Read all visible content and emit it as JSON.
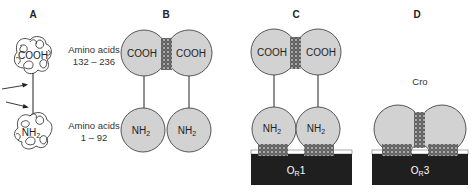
{
  "figure": {
    "colors": {
      "domain_fill": "#d2d2d2",
      "outline": "#444444",
      "dna_fill": "#1f1f1f",
      "contact_fill": "#8a8a8a",
      "text": "#222222"
    },
    "panels": [
      {
        "letter": "A",
        "top_domain": "COOH",
        "bottom_domain": "NH",
        "bottom_subscript": "2",
        "top_range_label": "Amino acids",
        "top_range_value": "132 – 236",
        "bottom_range_label": "Amino acids",
        "bottom_range_value": "1 – 92",
        "arrows": 2
      },
      {
        "letter": "B",
        "left_top": "COOH",
        "right_top": "COOH",
        "left_bottom": "NH",
        "right_bottom": "NH",
        "subscript": "2"
      },
      {
        "letter": "C",
        "left_top": "COOH",
        "right_top": "COOH",
        "left_bottom": "NH",
        "right_bottom": "NH",
        "subscript": "2",
        "operator": "O",
        "operator_sub": "R",
        "operator_num": "1"
      },
      {
        "letter": "D",
        "protein_label": "Cro",
        "operator": "O",
        "operator_sub": "R",
        "operator_num": "3"
      }
    ]
  }
}
